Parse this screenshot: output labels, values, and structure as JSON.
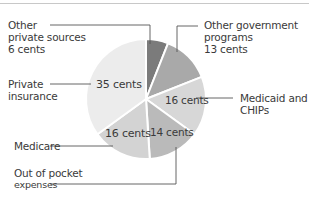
{
  "chart_data": {
    "type": "pie",
    "title": "",
    "unit": "cents",
    "start_angle": "12 o'clock",
    "direction": "clockwise",
    "slices": [
      {
        "name": "Other private sources",
        "label_lines": [
          "Other",
          "private sources",
          "6 cents"
        ],
        "value": 6,
        "value_label": "",
        "color": "#7b7b7b"
      },
      {
        "name": "Other government programs",
        "label_lines": [
          "Other government",
          "programs",
          "13 cents"
        ],
        "value": 13,
        "value_label": "",
        "color": "#a9a9a9"
      },
      {
        "name": "Medicaid and CHIPs",
        "label_lines": [
          "Medicaid and",
          "CHIPs"
        ],
        "value": 16,
        "value_label": "16 cents",
        "color": "#d7d7d7"
      },
      {
        "name": "Out of pocket expenses",
        "label_lines": [
          "Out of pocket",
          "expenses"
        ],
        "value": 14,
        "value_label": "14 cents",
        "color": "#bababa"
      },
      {
        "name": "Medicare",
        "label_lines": [
          "Medicare"
        ],
        "value": 16,
        "value_label": "16 cents",
        "color": "#d3d3d3"
      },
      {
        "name": "Private insurance",
        "label_lines": [
          "Private",
          "insurance"
        ],
        "value": 35,
        "value_label": "35 cents",
        "color": "#ececec"
      }
    ],
    "legend": "none (callout labels with leader lines)",
    "grid": false
  },
  "labels": {
    "other_private": {
      "l1": "Other",
      "l2": "private sources",
      "l3": "6 cents"
    },
    "other_gov": {
      "l1": "Other government",
      "l2": "programs",
      "l3": "13 cents"
    },
    "medicaid": {
      "l1": "Medicaid and",
      "l2": "CHIPs",
      "inner": "16 cents"
    },
    "out_of_pocket": {
      "l1": "Out of pocket",
      "l2": "expenses",
      "inner": "14 cents"
    },
    "medicare": {
      "l1": "Medicare",
      "inner": "16 cents"
    },
    "private": {
      "l1": "Private",
      "l2": "insurance",
      "inner": "35 cents"
    }
  }
}
